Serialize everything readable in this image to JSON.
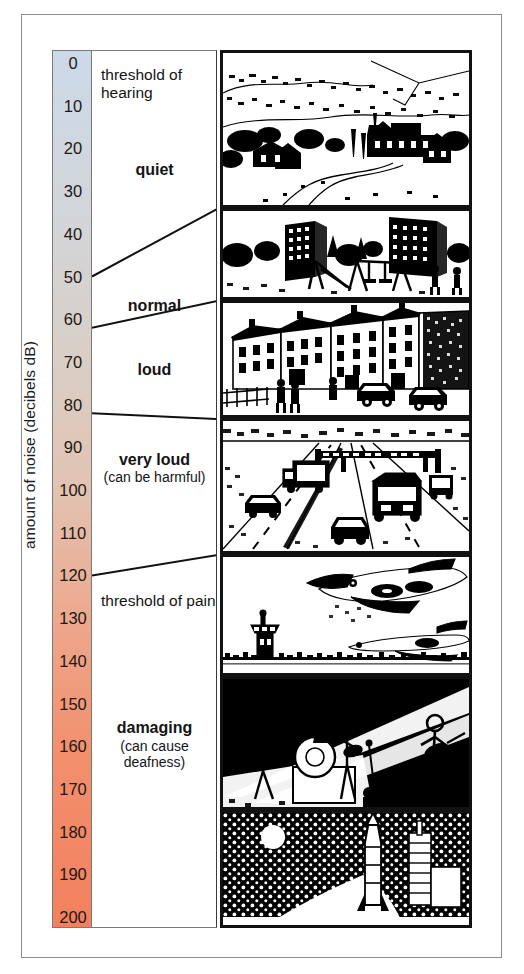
{
  "figure": {
    "axis_title": "amount of noise (decibels dB)",
    "frame_color": "#8d8d8d"
  },
  "chart_data": {
    "type": "bar",
    "title": "amount of noise (decibels dB)",
    "ylabel": "amount of noise (decibels dB)",
    "xlabel": "",
    "ylim": [
      0,
      200
    ],
    "grid": false,
    "legend": "none",
    "orientation": "vertical-scale",
    "tick_step": 10,
    "tick_labels": [
      "0",
      "10",
      "20",
      "30",
      "40",
      "50",
      "60",
      "70",
      "80",
      "90",
      "100",
      "110",
      "120",
      "130",
      "140",
      "150",
      "160",
      "170",
      "180",
      "190",
      "200"
    ],
    "tick_values": [
      0,
      10,
      20,
      30,
      40,
      50,
      60,
      70,
      80,
      90,
      100,
      110,
      120,
      130,
      140,
      150,
      160,
      170,
      180,
      190,
      200
    ],
    "gradient_stops": [
      {
        "value": 0,
        "color": "#ccd9e9"
      },
      {
        "value": 40,
        "color": "#d3d5d8"
      },
      {
        "value": 70,
        "color": "#d9cfc6"
      },
      {
        "value": 100,
        "color": "#e2c3b2"
      },
      {
        "value": 130,
        "color": "#eda88d"
      },
      {
        "value": 160,
        "color": "#f2906d"
      },
      {
        "value": 200,
        "color": "#f3805f"
      }
    ],
    "categories": [
      "quiet",
      "normal",
      "loud",
      "very loud",
      "threshold of pain",
      "damaging"
    ],
    "bands": [
      {
        "label": "threshold of hearing",
        "sub": "",
        "style": "plain",
        "from": 0,
        "to": 8,
        "anchor": 5
      },
      {
        "label": "quiet",
        "sub": "",
        "style": "strong",
        "from": 0,
        "to": 50,
        "anchor": 25
      },
      {
        "label": "normal",
        "sub": "",
        "style": "strong",
        "from": 50,
        "to": 62,
        "anchor": 57
      },
      {
        "label": "loud",
        "sub": "",
        "style": "strong",
        "from": 62,
        "to": 82,
        "anchor": 72
      },
      {
        "label": "very loud",
        "sub": "(can be harmful)",
        "style": "strong",
        "from": 82,
        "to": 120,
        "anchor": 95
      },
      {
        "label": "threshold of pain",
        "sub": "",
        "style": "plain",
        "from": 120,
        "to": 140,
        "anchor": 128
      },
      {
        "label": "damaging",
        "sub": "(can cause deafness)",
        "style": "strong",
        "from": 140,
        "to": 200,
        "anchor": 160
      }
    ],
    "boundaries_db": [
      50,
      62,
      82,
      120
    ],
    "panels": [
      {
        "name": "countryside-village",
        "caption": "quiet countryside village with church",
        "from_db": 0,
        "to_db": 50
      },
      {
        "name": "playground",
        "caption": "playground with swings beside tower blocks",
        "from_db": 50,
        "to_db": 62
      },
      {
        "name": "city-street",
        "caption": "busy city street with traffic and people",
        "from_db": 62,
        "to_db": 82
      },
      {
        "name": "motorway",
        "caption": "motorway with lorries, cars and sign gantry",
        "from_db": 82,
        "to_db": 120
      },
      {
        "name": "jet-airport",
        "caption": "jet aircraft taking off at an airport",
        "from_db": 120,
        "to_db": 140
      },
      {
        "name": "rock-concert",
        "caption": "rock band on a spotlit stage",
        "from_db": 140,
        "to_db": 175
      },
      {
        "name": "rocket-launch",
        "caption": "rocket launching at night",
        "from_db": 175,
        "to_db": 200
      }
    ]
  }
}
